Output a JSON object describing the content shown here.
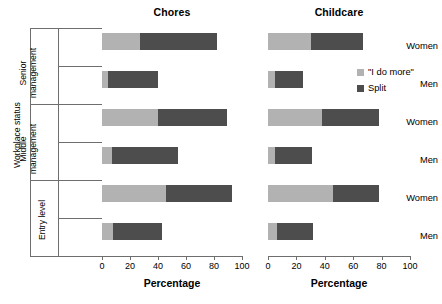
{
  "chart_data": {
    "type": "bar",
    "orientation": "horizontal",
    "stacked": true,
    "panels": [
      {
        "title": "Chores",
        "xlabel": "Percentage",
        "xlim": [
          0,
          100
        ],
        "categories": [
          "Women",
          "Men",
          "Women",
          "Men",
          "Women",
          "Men"
        ],
        "series": [
          {
            "name": "\"I do more\"",
            "color": "#b2b2b2",
            "values": [
              27,
              4,
              40,
              7,
              46,
              8
            ]
          },
          {
            "name": "Split",
            "color": "#4d4d4d",
            "values": [
              55,
              36,
              49,
              47,
              47,
              35
            ]
          }
        ]
      },
      {
        "title": "Childcare",
        "xlabel": "Percentage",
        "xlim": [
          0,
          100
        ],
        "categories": [
          "Women",
          "Men",
          "Women",
          "Men",
          "Women",
          "Men"
        ],
        "series": [
          {
            "name": "\"I do more\"",
            "color": "#b2b2b2",
            "values": [
              30,
              5,
              38,
              5,
              46,
              6
            ]
          },
          {
            "name": "Split",
            "color": "#4d4d4d",
            "values": [
              37,
              20,
              40,
              26,
              32,
              26
            ]
          }
        ]
      }
    ],
    "group_label": "Workplace status",
    "groups": [
      "Senior management",
      "Middle management",
      "Entry level"
    ],
    "xticks": [
      0,
      20,
      40,
      60,
      80,
      100
    ],
    "grid": false,
    "legend_position": "right"
  },
  "panels": {
    "chores": {
      "title": "Chores",
      "xlabel": "Percentage"
    },
    "childcare": {
      "title": "Childcare",
      "xlabel": "Percentage"
    }
  },
  "yaxis": {
    "group_label": "Workplace status",
    "groups": [
      {
        "label": "Senior management",
        "line1": "Senior",
        "line2": "management"
      },
      {
        "label": "Middle management",
        "line1": "Middle",
        "line2": "management"
      },
      {
        "label": "Entry level",
        "line1": "Entry level",
        "line2": ""
      }
    ],
    "sex_labels": [
      "Women",
      "Men",
      "Women",
      "Men",
      "Women",
      "Men"
    ]
  },
  "xticks": {
    "labels": [
      "0",
      "20",
      "40",
      "60",
      "80",
      "100"
    ]
  },
  "legend": {
    "items": [
      {
        "label": "\"I do more\"",
        "color": "#b2b2b2",
        "icon": "square-swatch-light"
      },
      {
        "label": "Split",
        "color": "#4d4d4d",
        "icon": "square-swatch-dark"
      }
    ]
  }
}
